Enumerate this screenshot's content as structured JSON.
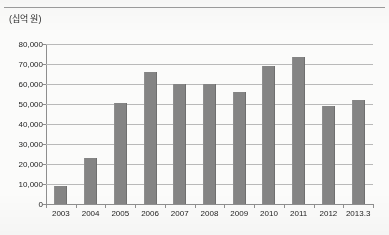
{
  "page": {
    "top_cropped_text": "－ － － － － － － －",
    "unit_label": "(십억 원)"
  },
  "colors": {
    "bar": "#848484",
    "gridline": "#b9b9b9",
    "axis": "#8e8e8e",
    "text": "#232323",
    "background": "#fbfbfa"
  },
  "chart_data": {
    "type": "bar",
    "title": "",
    "subtitle": "",
    "xlabel": "",
    "ylabel": "(십억 원)",
    "ylim": [
      0,
      80000
    ],
    "ytick_step": 10000,
    "grid": true,
    "legend": "none",
    "categories": [
      "2003",
      "2004",
      "2005",
      "2006",
      "2007",
      "2008",
      "2009",
      "2010",
      "2011",
      "2012",
      "2013.3"
    ],
    "values": [
      9000,
      23000,
      50500,
      66000,
      60000,
      60000,
      56000,
      69000,
      73500,
      49000,
      52000
    ],
    "ytick_labels": [
      "80,000",
      "70,000",
      "60,000",
      "50,000",
      "40,000",
      "30,000",
      "20,000",
      "10,000",
      "0"
    ],
    "ytick_values": [
      80000,
      70000,
      60000,
      50000,
      40000,
      30000,
      20000,
      10000,
      0
    ]
  }
}
